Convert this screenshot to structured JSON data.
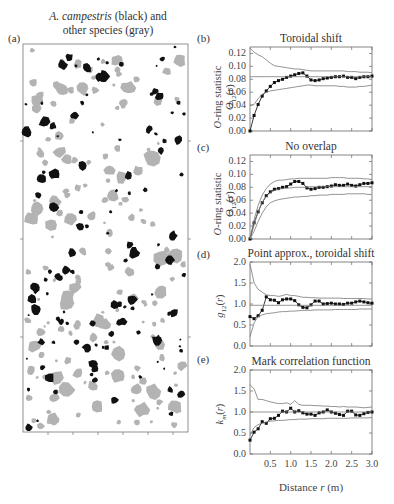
{
  "figure": {
    "map_panel": {
      "label": "(a)",
      "title_line1_italic": "A. campestris",
      "title_line1_rest": " (black) and",
      "title_line2": "other species (gray)",
      "colors": {
        "focal": "#111111",
        "other": "#b3b3b3"
      }
    },
    "xaxis": {
      "label": "Distance r (m)",
      "ticks": [
        "0.5",
        "1.0",
        "1.5",
        "2.0",
        "2.5",
        "3.0"
      ]
    }
  },
  "chart_data": [
    {
      "panel": "(b)",
      "type": "line",
      "title": "Toroidal shift",
      "ylabel": "O-ring statistic O12(r)",
      "xlabel": "Distance r (m)",
      "xlim": [
        0,
        3.0
      ],
      "ylim": [
        0,
        0.13
      ],
      "yticks": [
        "0.12",
        "0.10",
        "0.08",
        "0.06",
        "0.04",
        "0.02",
        "0.00"
      ],
      "x": [
        0.0,
        0.1,
        0.2,
        0.3,
        0.4,
        0.5,
        0.6,
        0.7,
        0.8,
        0.9,
        1.0,
        1.1,
        1.2,
        1.3,
        1.4,
        1.5,
        1.6,
        1.7,
        1.8,
        1.9,
        2.0,
        2.1,
        2.2,
        2.3,
        2.4,
        2.5,
        2.6,
        2.7,
        2.8,
        2.9,
        3.0
      ],
      "series": [
        {
          "name": "observed",
          "values": [
            0.0,
            0.024,
            0.041,
            0.054,
            0.062,
            0.069,
            0.075,
            0.078,
            0.08,
            0.083,
            0.085,
            0.087,
            0.089,
            0.09,
            0.085,
            0.079,
            0.078,
            0.079,
            0.081,
            0.082,
            0.083,
            0.084,
            0.084,
            0.085,
            0.083,
            0.083,
            0.081,
            0.083,
            0.084,
            0.084,
            0.085
          ]
        },
        {
          "name": "upper envelope",
          "values": [
            0.128,
            0.122,
            0.118,
            0.115,
            0.11,
            0.105,
            0.101,
            0.1,
            0.099,
            0.098,
            0.097,
            0.096,
            0.096,
            0.095,
            0.094,
            0.093,
            0.093,
            0.093,
            0.093,
            0.093,
            0.093,
            0.093,
            0.093,
            0.093,
            0.092,
            0.092,
            0.092,
            0.091,
            0.091,
            0.091,
            0.09
          ]
        },
        {
          "name": "lower envelope",
          "values": [
            0.04,
            0.041,
            0.05,
            0.057,
            0.06,
            0.062,
            0.063,
            0.064,
            0.065,
            0.066,
            0.067,
            0.068,
            0.069,
            0.07,
            0.071,
            0.071,
            0.07,
            0.07,
            0.07,
            0.07,
            0.07,
            0.07,
            0.069,
            0.069,
            0.068,
            0.068,
            0.068,
            0.069,
            0.069,
            0.07,
            0.071
          ]
        },
        {
          "name": "expected",
          "values": [
            0.084,
            0.084,
            0.084,
            0.084,
            0.084,
            0.084,
            0.084,
            0.084,
            0.084,
            0.084,
            0.084,
            0.084,
            0.084,
            0.084,
            0.084,
            0.084,
            0.084,
            0.084,
            0.084,
            0.084,
            0.084,
            0.084,
            0.084,
            0.084,
            0.084,
            0.084,
            0.084,
            0.084,
            0.084,
            0.084,
            0.084
          ]
        }
      ]
    },
    {
      "panel": "(c)",
      "type": "line",
      "title": "No overlap",
      "ylabel": "O-ring statistic O12(r)",
      "xlabel": "Distance r (m)",
      "xlim": [
        0,
        3.0
      ],
      "ylim": [
        0,
        0.13
      ],
      "yticks": [
        "0.12",
        "0.10",
        "0.08",
        "0.06",
        "0.04",
        "0.02",
        "0.00"
      ],
      "x": [
        0.0,
        0.1,
        0.2,
        0.3,
        0.4,
        0.5,
        0.6,
        0.7,
        0.8,
        0.9,
        1.0,
        1.1,
        1.2,
        1.3,
        1.4,
        1.5,
        1.6,
        1.7,
        1.8,
        1.9,
        2.0,
        2.1,
        2.2,
        2.3,
        2.4,
        2.5,
        2.6,
        2.7,
        2.8,
        2.9,
        3.0
      ],
      "series": [
        {
          "name": "observed",
          "values": [
            0.0,
            0.025,
            0.042,
            0.056,
            0.067,
            0.073,
            0.077,
            0.078,
            0.08,
            0.081,
            0.085,
            0.089,
            0.089,
            0.086,
            0.079,
            0.077,
            0.078,
            0.08,
            0.08,
            0.081,
            0.082,
            0.084,
            0.083,
            0.083,
            0.085,
            0.083,
            0.082,
            0.084,
            0.086,
            0.086,
            0.087
          ]
        },
        {
          "name": "upper envelope",
          "values": [
            0.0,
            0.03,
            0.052,
            0.068,
            0.078,
            0.085,
            0.089,
            0.091,
            0.091,
            0.092,
            0.093,
            0.093,
            0.094,
            0.094,
            0.094,
            0.094,
            0.094,
            0.094,
            0.094,
            0.094,
            0.095,
            0.095,
            0.095,
            0.095,
            0.094,
            0.094,
            0.094,
            0.094,
            0.093,
            0.093,
            0.092
          ]
        },
        {
          "name": "expected",
          "values": [
            0.0,
            0.022,
            0.042,
            0.057,
            0.066,
            0.072,
            0.075,
            0.077,
            0.078,
            0.079,
            0.079,
            0.08,
            0.08,
            0.08,
            0.08,
            0.081,
            0.081,
            0.081,
            0.081,
            0.081,
            0.081,
            0.081,
            0.081,
            0.081,
            0.081,
            0.081,
            0.081,
            0.081,
            0.081,
            0.081,
            0.081
          ]
        },
        {
          "name": "lower envelope",
          "values": [
            0.0,
            0.012,
            0.027,
            0.04,
            0.05,
            0.056,
            0.059,
            0.061,
            0.062,
            0.063,
            0.064,
            0.065,
            0.065,
            0.066,
            0.066,
            0.067,
            0.067,
            0.068,
            0.068,
            0.068,
            0.069,
            0.069,
            0.069,
            0.069,
            0.07,
            0.07,
            0.07,
            0.07,
            0.07,
            0.069,
            0.069
          ]
        }
      ]
    },
    {
      "panel": "(d)",
      "type": "line",
      "title": "Point approx., toroidal shift",
      "ylabel": "g12(r)",
      "xlabel": "Distance r (m)",
      "xlim": [
        0,
        3.0
      ],
      "ylim": [
        0,
        2.0
      ],
      "yticks": [
        "2.0",
        "1.5",
        "1.0",
        "0.5",
        "0.0"
      ],
      "x": [
        0.0,
        0.1,
        0.2,
        0.3,
        0.4,
        0.5,
        0.6,
        0.7,
        0.8,
        0.9,
        1.0,
        1.1,
        1.2,
        1.3,
        1.4,
        1.5,
        1.6,
        1.7,
        1.8,
        1.9,
        2.0,
        2.1,
        2.2,
        2.3,
        2.4,
        2.5,
        2.6,
        2.7,
        2.8,
        2.9,
        3.0
      ],
      "series": [
        {
          "name": "observed",
          "values": [
            0.7,
            0.65,
            0.72,
            0.85,
            1.17,
            1.1,
            1.09,
            1.03,
            1.1,
            1.12,
            1.12,
            1.08,
            0.98,
            0.92,
            0.91,
            0.98,
            1.07,
            1.07,
            1.0,
            1.01,
            1.02,
            1.0,
            1.0,
            0.99,
            1.02,
            1.02,
            1.05,
            1.07,
            1.05,
            1.03,
            1.02
          ]
        },
        {
          "name": "upper envelope",
          "values": [
            1.95,
            1.5,
            1.35,
            1.28,
            1.22,
            1.2,
            1.2,
            1.18,
            1.2,
            1.23,
            1.2,
            1.2,
            1.18,
            1.16,
            1.16,
            1.15,
            1.15,
            1.14,
            1.14,
            1.14,
            1.14,
            1.14,
            1.14,
            1.13,
            1.13,
            1.13,
            1.13,
            1.13,
            1.13,
            1.12,
            1.12
          ]
        },
        {
          "name": "lower envelope",
          "values": [
            0.22,
            0.55,
            0.7,
            0.74,
            0.77,
            0.78,
            0.79,
            0.81,
            0.82,
            0.82,
            0.83,
            0.83,
            0.84,
            0.85,
            0.85,
            0.85,
            0.86,
            0.86,
            0.86,
            0.86,
            0.86,
            0.87,
            0.87,
            0.87,
            0.87,
            0.87,
            0.87,
            0.88,
            0.88,
            0.88,
            0.88
          ]
        },
        {
          "name": "expected",
          "values": [
            0.97,
            0.97,
            0.97,
            0.97,
            0.97,
            0.97,
            0.97,
            0.97,
            0.97,
            0.97,
            0.97,
            0.97,
            0.97,
            0.97,
            0.97,
            0.97,
            0.97,
            0.97,
            0.97,
            0.97,
            0.97,
            0.97,
            0.97,
            0.97,
            0.97,
            0.97,
            0.97,
            0.97,
            0.97,
            0.97,
            0.97
          ]
        }
      ]
    },
    {
      "panel": "(e)",
      "type": "line",
      "title": "Mark correlation function",
      "ylabel": "km(r)",
      "xlabel": "Distance r (m)",
      "xlim": [
        0,
        3.0
      ],
      "ylim": [
        0,
        2.0
      ],
      "yticks": [
        "2.0",
        "1.5",
        "1.0",
        "0.5",
        "0.0"
      ],
      "xticks": [
        "0.5",
        "1.0",
        "1.5",
        "2.0",
        "2.5",
        "3.0"
      ],
      "x": [
        0.0,
        0.1,
        0.2,
        0.3,
        0.4,
        0.5,
        0.6,
        0.7,
        0.8,
        0.9,
        1.0,
        1.1,
        1.2,
        1.3,
        1.4,
        1.5,
        1.6,
        1.7,
        1.8,
        1.9,
        2.0,
        2.1,
        2.2,
        2.3,
        2.4,
        2.5,
        2.6,
        2.7,
        2.8,
        2.9,
        3.0
      ],
      "series": [
        {
          "name": "observed",
          "values": [
            0.33,
            0.52,
            0.6,
            0.77,
            0.73,
            0.84,
            0.85,
            0.92,
            1.02,
            1.0,
            1.09,
            1.0,
            1.03,
            0.98,
            0.95,
            0.95,
            0.92,
            0.98,
            1.0,
            1.05,
            1.0,
            0.97,
            0.94,
            0.92,
            1.02,
            1.02,
            0.93,
            0.92,
            0.96,
            0.99,
            1.0
          ]
        },
        {
          "name": "upper envelope",
          "values": [
            1.65,
            1.55,
            1.3,
            1.3,
            1.27,
            1.24,
            1.22,
            1.2,
            1.2,
            1.22,
            1.18,
            1.27,
            1.18,
            1.16,
            1.16,
            1.16,
            1.15,
            1.15,
            1.14,
            1.14,
            1.13,
            1.13,
            1.12,
            1.13,
            1.12,
            1.12,
            1.12,
            1.11,
            1.1,
            1.11,
            1.12
          ]
        },
        {
          "name": "lower envelope",
          "values": [
            0.45,
            0.63,
            0.7,
            0.73,
            0.76,
            0.78,
            0.79,
            0.8,
            0.8,
            0.81,
            0.82,
            0.82,
            0.83,
            0.83,
            0.83,
            0.84,
            0.84,
            0.84,
            0.84,
            0.85,
            0.85,
            0.85,
            0.85,
            0.85,
            0.85,
            0.86,
            0.86,
            0.86,
            0.86,
            0.86,
            0.87
          ]
        },
        {
          "name": "expected",
          "values": [
            1.0,
            1.0,
            1.0,
            1.0,
            1.0,
            1.0,
            1.0,
            1.0,
            1.0,
            1.0,
            1.0,
            1.0,
            1.0,
            1.0,
            1.0,
            1.0,
            1.0,
            1.0,
            1.0,
            1.0,
            1.0,
            1.0,
            1.0,
            1.0,
            1.0,
            1.0,
            1.0,
            1.0,
            1.0,
            1.0,
            1.0
          ]
        }
      ]
    }
  ]
}
